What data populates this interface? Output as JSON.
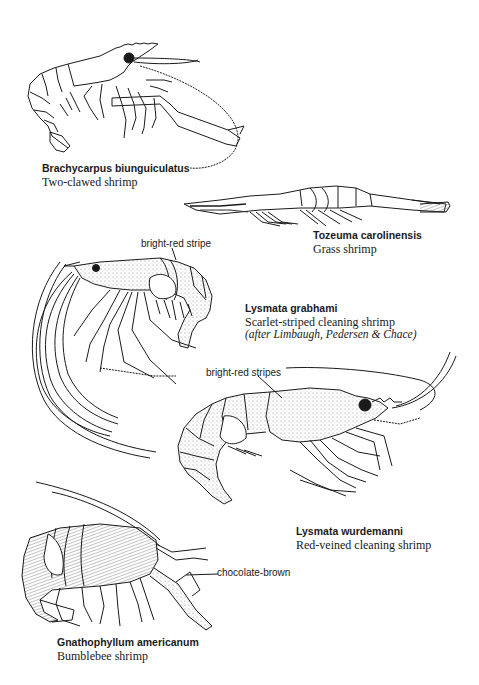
{
  "species": [
    {
      "scientific_name": "Brachycarpus biunguiculatus",
      "common_name": "Two-clawed shrimp"
    },
    {
      "scientific_name": "Tozeuma carolinensis",
      "common_name": "Grass shrimp"
    },
    {
      "scientific_name": "Lysmata grabhami",
      "common_name": "Scarlet-striped cleaning shrimp",
      "credit": "(after Limbaugh, Pedersen & Chace)",
      "annotation": "bright-red stripe"
    },
    {
      "scientific_name": "Lysmata wurdemanni",
      "common_name": "Red-veined cleaning shrimp",
      "annotation": "bright-red stripes"
    },
    {
      "scientific_name": "Gnathophyllum americanum",
      "common_name": "Bumblebee shrimp",
      "annotation": "chocolate-brown"
    }
  ],
  "illustrations": [
    {
      "name": "two-clawed-shrimp-drawing"
    },
    {
      "name": "grass-shrimp-drawing"
    },
    {
      "name": "scarlet-striped-cleaning-shrimp-drawing"
    },
    {
      "name": "red-veined-cleaning-shrimp-drawing"
    },
    {
      "name": "bumblebee-shrimp-drawing"
    }
  ],
  "colors": {
    "ink": "#1a1a1a",
    "paper": "#ffffff",
    "stipple": "#9a9a9a"
  }
}
